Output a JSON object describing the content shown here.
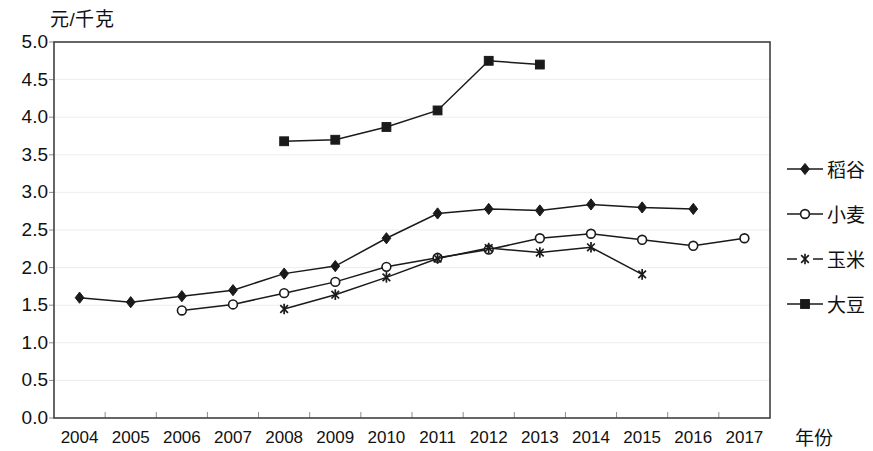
{
  "chart_data": {
    "type": "line",
    "title": "",
    "subtitle": "",
    "xlabel": "年份",
    "ylabel": "元/千克",
    "ylim": [
      0.0,
      5.0
    ],
    "ytick_labels": [
      "5.0",
      "4.5",
      "4.0",
      "3.5",
      "3.0",
      "2.5",
      "2.0",
      "1.5",
      "1.0",
      "0.5",
      "0.0"
    ],
    "ytick_values": [
      5.0,
      4.5,
      4.0,
      3.5,
      3.0,
      2.5,
      2.0,
      1.5,
      1.0,
      0.5,
      0.0
    ],
    "grid": true,
    "legend_position": "right",
    "categories": [
      "2004",
      "2005",
      "2006",
      "2007",
      "2008",
      "2009",
      "2010",
      "2011",
      "2012",
      "2013",
      "2014",
      "2015",
      "2016",
      "2017"
    ],
    "series": [
      {
        "name": "稻谷",
        "marker": "filled-diamond",
        "values": [
          1.6,
          1.54,
          1.62,
          1.7,
          1.92,
          2.02,
          2.39,
          2.72,
          2.78,
          2.76,
          2.84,
          2.8,
          2.78,
          null
        ]
      },
      {
        "name": "小麦",
        "marker": "open-circle",
        "values": [
          null,
          null,
          1.43,
          1.51,
          1.66,
          1.81,
          2.01,
          2.13,
          2.24,
          2.39,
          2.45,
          2.37,
          2.29,
          2.39
        ]
      },
      {
        "name": "玉米",
        "marker": "asterisk",
        "values": [
          null,
          null,
          null,
          null,
          1.45,
          1.64,
          1.87,
          2.12,
          2.26,
          2.2,
          2.27,
          1.91,
          null,
          null
        ]
      },
      {
        "name": "大豆",
        "marker": "filled-square",
        "values": [
          null,
          null,
          null,
          null,
          3.68,
          3.7,
          3.87,
          4.09,
          4.75,
          4.7,
          null,
          null,
          null,
          null
        ]
      }
    ]
  },
  "colors": {
    "ink": "#1a1a1a",
    "frame": "#404040",
    "grid": "#ededed",
    "background": "#ffffff"
  }
}
